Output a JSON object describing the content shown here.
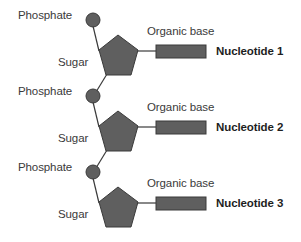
{
  "colors": {
    "shape_fill": "#5f5f5f",
    "shape_stroke": "#3a3a3a",
    "line": "#3a3a3a",
    "label_text": "#3a3a3a",
    "nucleotide_label_text": "#1e1e1e",
    "background": "#ffffff"
  },
  "nucleotides": [
    {
      "phosphate_label": "Phosphate",
      "sugar_label": "Sugar",
      "base_label": "Organic base",
      "name": "Nucleotide 1"
    },
    {
      "phosphate_label": "Phosphate",
      "sugar_label": "Sugar",
      "base_label": "Organic base",
      "name": "Nucleotide 2"
    },
    {
      "phosphate_label": "Phosphate",
      "sugar_label": "Sugar",
      "base_label": "Organic base",
      "name": "Nucleotide 3"
    }
  ]
}
